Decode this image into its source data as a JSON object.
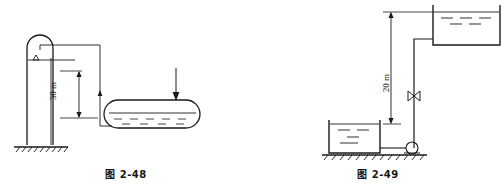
{
  "page": {
    "background_color": "#ffffff",
    "line_color": "#1a1a1a",
    "text_color": "#161616"
  },
  "figures": [
    {
      "id": "fig-2-48",
      "caption": "图 2-48",
      "dimension": {
        "label": "30 m",
        "value": 30,
        "unit": "m",
        "measures": "height from tank liquid level to standpipe water level"
      },
      "elements": [
        {
          "name": "standpipe",
          "type": "vertical-column-rounded-top"
        },
        {
          "name": "water-level-marker",
          "type": "triangle-symbol"
        },
        {
          "name": "pipe-run",
          "type": "polyline-pipe"
        },
        {
          "name": "horizontal-tank",
          "type": "rounded-cylinder"
        },
        {
          "name": "tank-liquid",
          "type": "dashed-fill"
        },
        {
          "name": "inlet-arrow",
          "type": "down-arrow"
        },
        {
          "name": "ground",
          "type": "hatched-ground-line"
        }
      ]
    },
    {
      "id": "fig-2-49",
      "caption": "图 2-49",
      "dimension": {
        "label": "20 m",
        "value": 20,
        "unit": "m",
        "measures": "height from lower tank liquid level to upper tank liquid level"
      },
      "elements": [
        {
          "name": "upper-tank",
          "type": "open-top-rectangular-tank"
        },
        {
          "name": "upper-tank-liquid",
          "type": "dashed-fill"
        },
        {
          "name": "lower-tank",
          "type": "open-top-rectangular-tank"
        },
        {
          "name": "lower-tank-liquid",
          "type": "dashed-fill"
        },
        {
          "name": "riser-pipe",
          "type": "polyline-pipe"
        },
        {
          "name": "valve",
          "type": "bowtie-valve-symbol"
        },
        {
          "name": "pump",
          "type": "centrifugal-pump-symbol"
        },
        {
          "name": "ground",
          "type": "hatched-ground-line"
        }
      ]
    }
  ]
}
